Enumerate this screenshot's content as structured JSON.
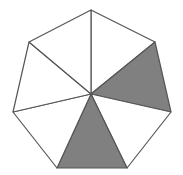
{
  "diagram": {
    "shape": "regular heptagon",
    "sides": 7,
    "center": [
      91,
      94
    ],
    "vertices": [
      [
        91,
        10
      ],
      [
        155,
        42
      ],
      [
        171,
        112
      ],
      [
        127,
        168
      ],
      [
        57,
        168
      ],
      [
        13,
        112
      ],
      [
        29,
        42
      ]
    ],
    "sectors_total": 7,
    "sectors_shaded": [
      1,
      3
    ],
    "shaded_fraction": "2/7",
    "colors": {
      "stroke": "#555555",
      "shade": "#808080",
      "background": "#ffffff"
    }
  }
}
